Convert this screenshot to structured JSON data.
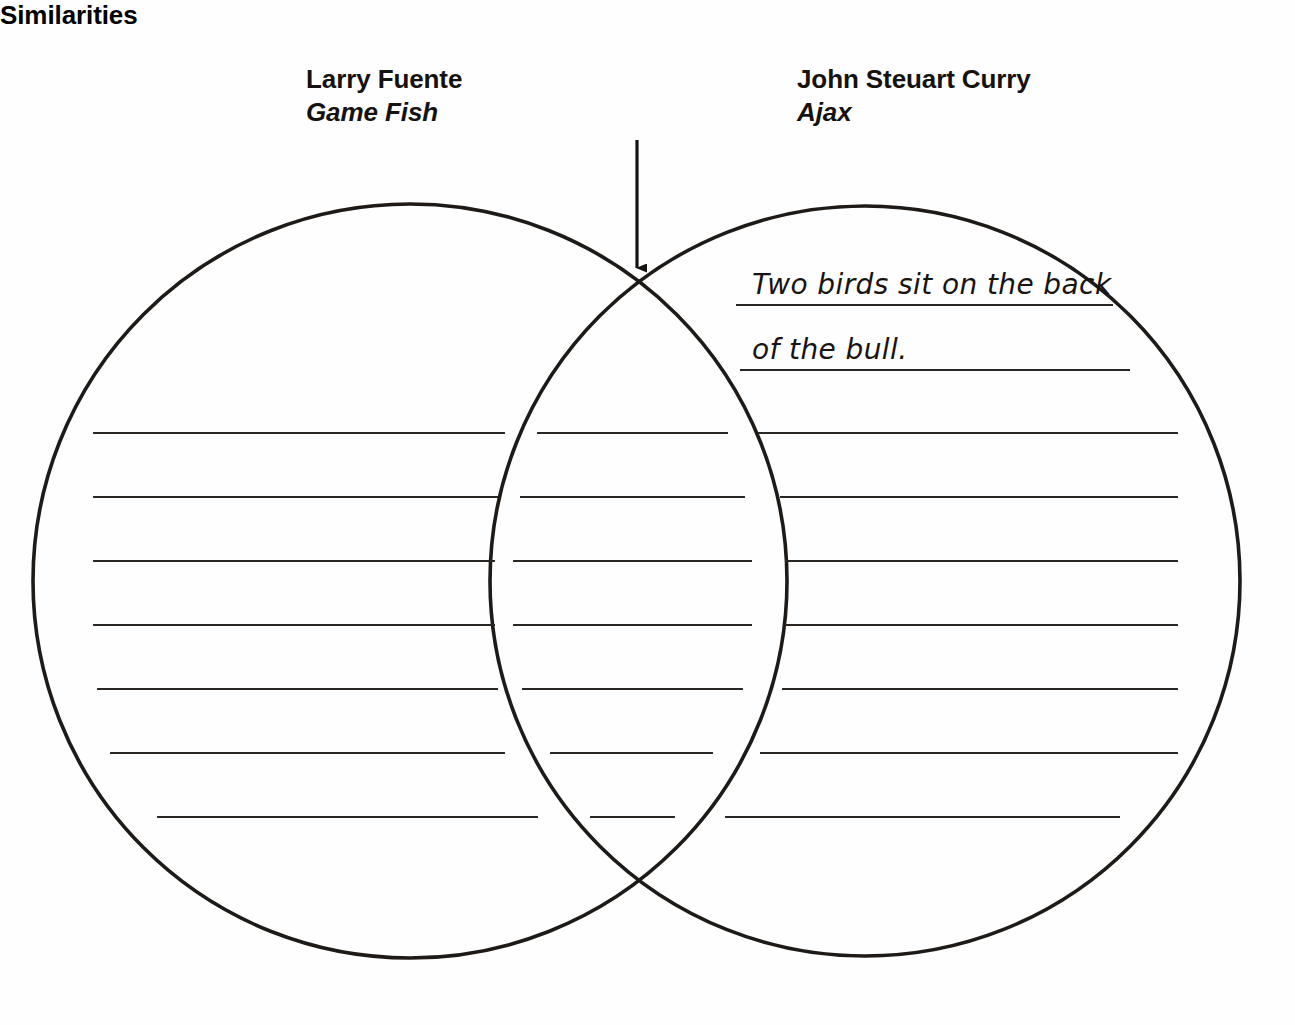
{
  "worksheet": {
    "type": "venn-diagram-comparison",
    "left_heading": {
      "artist": "Larry Fuente",
      "artwork": "Game Fish"
    },
    "middle_heading": {
      "label": "Similarities",
      "pointer": "down-arrow-icon"
    },
    "right_heading": {
      "artist": "John Steuart Curry",
      "artwork": "Ajax"
    },
    "answers": {
      "right_circle": [
        "Two birds sit on the back",
        "of the bull."
      ]
    },
    "writing_lines": {
      "rows": 7,
      "row_y": [
        433,
        497,
        561,
        625,
        689,
        753,
        817
      ],
      "left_region_count": 7,
      "middle_region_count": 7,
      "right_region_count": 7,
      "filled_right_rows": 2
    },
    "geometry": {
      "left_circle": {
        "cx": 410,
        "cy": 581,
        "r": 377
      },
      "right_circle": {
        "cx": 865,
        "cy": 581,
        "r": 375
      },
      "intersection_top": {
        "x": 637,
        "y": 283
      },
      "intersection_bottom": {
        "x": 637,
        "y": 879
      }
    },
    "colors": {
      "ink": "#15120f",
      "rule": "#2a2623",
      "page": "#fefefe"
    }
  }
}
